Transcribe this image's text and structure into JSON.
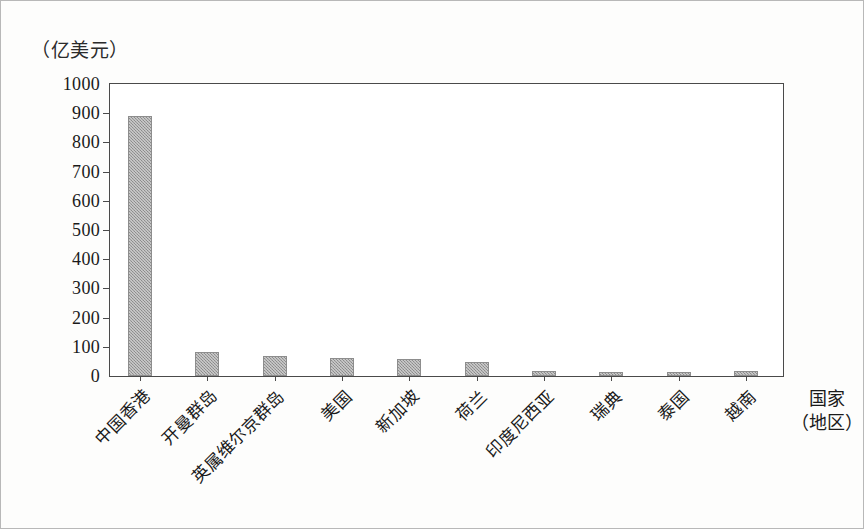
{
  "chart_data": {
    "type": "bar",
    "title": "",
    "subtitle": "",
    "ylabel": "（亿美元）",
    "xlabel": "国家",
    "xlabel_line2": "（地区）",
    "ylim": [
      0,
      1000
    ],
    "ytick_step": 100,
    "yticks": [
      0,
      100,
      200,
      300,
      400,
      500,
      600,
      700,
      800,
      900,
      1000
    ],
    "ytick_labels": [
      "0",
      "100",
      "200",
      "300",
      "400",
      "500",
      "600",
      "700",
      "800",
      "900",
      "1000"
    ],
    "grid": false,
    "legend": null,
    "legend_position": "none",
    "bar_color": "#9c9c9c",
    "bar_edge_color": "#8d8d8d",
    "axis_color": "#4a4a4a",
    "categories": [
      "中国香港",
      "开曼群岛",
      "英属维尔京群岛",
      "美国",
      "新加坡",
      "荷兰",
      "印度尼西亚",
      "瑞典",
      "泰国",
      "越南"
    ],
    "values": [
      890,
      82,
      70,
      60,
      58,
      48,
      18,
      15,
      15,
      16
    ],
    "series": [
      {
        "name": "实际使用外资金额",
        "values": [
          890,
          82,
          70,
          60,
          58,
          48,
          18,
          15,
          15,
          16
        ]
      }
    ]
  }
}
